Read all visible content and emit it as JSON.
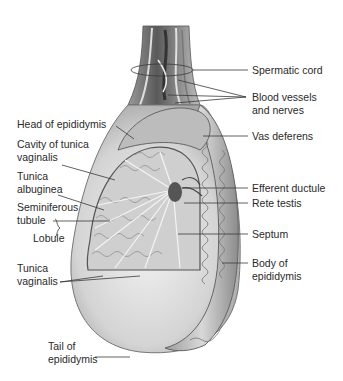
{
  "figure": {
    "labels_left": [
      {
        "id": "head-of-epididymis",
        "lines": [
          "Head of epididymis"
        ]
      },
      {
        "id": "cavity-of-tunica-vaginalis",
        "lines": [
          "Cavity of tunica",
          "vaginalis"
        ]
      },
      {
        "id": "tunica-albuginea",
        "lines": [
          "Tunica",
          "albuginea"
        ]
      },
      {
        "id": "seminiferous-tubule",
        "lines": [
          "Seminiferous",
          "tubule"
        ]
      },
      {
        "id": "lobule",
        "lines": [
          "Lobule"
        ]
      },
      {
        "id": "tunica-vaginalis",
        "lines": [
          "Tunica",
          "vaginalis"
        ]
      },
      {
        "id": "tail-of-epididymis",
        "lines": [
          "Tail of",
          "epididymis"
        ]
      }
    ],
    "labels_right": [
      {
        "id": "spermatic-cord",
        "lines": [
          "Spermatic cord"
        ]
      },
      {
        "id": "blood-vessels-and-nerves",
        "lines": [
          "Blood vessels",
          "and nerves"
        ]
      },
      {
        "id": "vas-deferens",
        "lines": [
          "Vas deferens"
        ]
      },
      {
        "id": "efferent-ductule",
        "lines": [
          "Efferent ductule"
        ]
      },
      {
        "id": "rete-testis",
        "lines": [
          "Rete testis"
        ]
      },
      {
        "id": "septum",
        "lines": [
          "Septum"
        ]
      },
      {
        "id": "body-of-epididymis",
        "lines": [
          "Body of",
          "epididymis"
        ]
      }
    ],
    "colors": {
      "text": "#2a2a2a",
      "leader": "#3a3a3a",
      "tissue_dark": "#6e6e6e",
      "tissue_mid": "#a8a8a8",
      "tissue_light": "#d6d6d6",
      "tunica_fill": "#e2e2e2"
    }
  }
}
